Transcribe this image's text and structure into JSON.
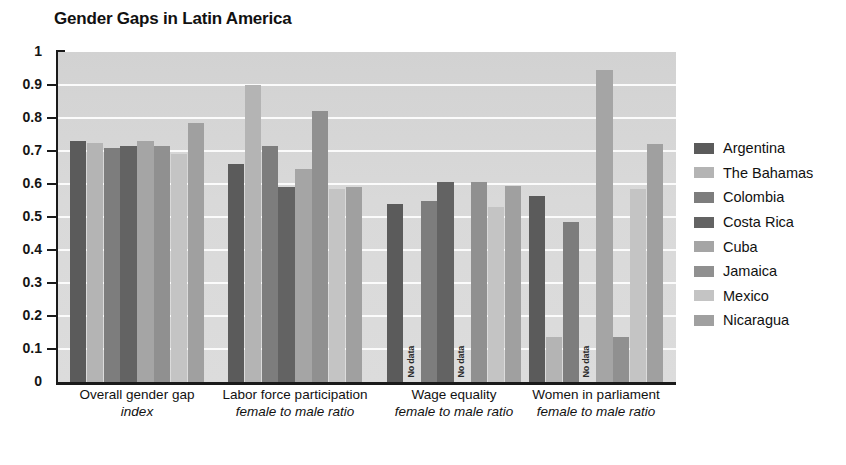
{
  "chart_data": {
    "type": "bar",
    "title": "Gender Gaps in Latin America",
    "xlabel": "",
    "ylabel": "",
    "ylim": [
      0,
      1
    ],
    "ytick_labels": [
      "1",
      "0.9",
      "0.8",
      "0.7",
      "0.6",
      "0.5",
      "0.4",
      "0.3",
      "0.2",
      "0.1",
      "0"
    ],
    "ytick_values": [
      1,
      0.9,
      0.8,
      0.7,
      0.6,
      0.5,
      0.4,
      0.3,
      0.2,
      0.1,
      0
    ],
    "grid": true,
    "legend_position": "right",
    "categories": [
      {
        "line1": "Overall gender gap",
        "line2": "index"
      },
      {
        "line1": "Labor force participation",
        "line2": "female to male ratio"
      },
      {
        "line1": "Wage equality",
        "line2": "female to male ratio"
      },
      {
        "line1": "Women in parliament",
        "line2": "female to male ratio"
      }
    ],
    "no_data_label": "No data",
    "series": [
      {
        "name": "Argentina",
        "color": "#5b5b5b",
        "values": [
          0.73,
          0.66,
          0.54,
          0.565
        ]
      },
      {
        "name": "The Bahamas",
        "color": "#b4b4b4",
        "values": [
          0.725,
          0.9,
          null,
          0.135
        ]
      },
      {
        "name": "Colombia",
        "color": "#7d7d7d",
        "values": [
          0.71,
          0.715,
          0.55,
          0.485
        ]
      },
      {
        "name": "Costa Rica",
        "color": "#636363",
        "values": [
          0.715,
          0.59,
          0.605,
          null
        ]
      },
      {
        "name": "Cuba",
        "color": "#a5a5a5",
        "values": [
          0.73,
          0.645,
          null,
          0.945
        ]
      },
      {
        "name": "Jamaica",
        "color": "#909090",
        "values": [
          0.715,
          0.82,
          0.605,
          0.135
        ]
      },
      {
        "name": "Mexico",
        "color": "#c4c4c4",
        "values": [
          0.69,
          0.585,
          0.53,
          0.585
        ]
      },
      {
        "name": "Nicaragua",
        "color": "#a0a0a0",
        "values": [
          0.785,
          0.59,
          0.595,
          0.72
        ]
      }
    ]
  }
}
